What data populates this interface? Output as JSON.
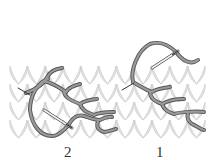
{
  "figure": {
    "colors": {
      "background": "#ffffff",
      "knit_fill": "#e4e4e4",
      "knit_outline": "#c4c4c4",
      "yarn_fill": "#9a9a9a",
      "yarn_outline": "#555555",
      "needle": "#f2f2f2",
      "needle_outline": "#444444"
    },
    "knit_fabric": {
      "x": 10,
      "y": 66,
      "width": 196,
      "height": 72,
      "columns": 11,
      "rows": 4
    }
  },
  "labels": {
    "step_2": "2",
    "step_1": "1"
  }
}
